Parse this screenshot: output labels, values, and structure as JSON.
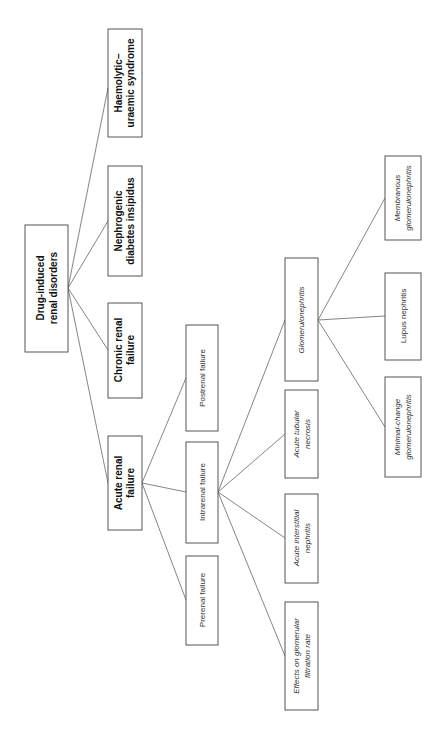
{
  "diagram": {
    "orientation": "rotated-90-ccw",
    "root": {
      "id": "root",
      "lines": [
        "Drug-induced",
        "renal disorders"
      ],
      "style": "bold"
    },
    "level1": [
      {
        "id": "hus",
        "lines": [
          "Haemolytic–",
          "uraemic syndrome"
        ],
        "style": "bold"
      },
      {
        "id": "ndi",
        "lines": [
          "Nephrogenic",
          "diabetes insipidus"
        ],
        "style": "bold"
      },
      {
        "id": "crf",
        "lines": [
          "Chronic renal",
          "failure"
        ],
        "style": "bold"
      },
      {
        "id": "arf",
        "lines": [
          "Acute renal",
          "failure"
        ],
        "style": "bold"
      }
    ],
    "level2": [
      {
        "id": "post",
        "lines": [
          "Postrenal failure"
        ],
        "style": "normal"
      },
      {
        "id": "intra",
        "lines": [
          "Intrarenal failure"
        ],
        "style": "normal"
      },
      {
        "id": "pre",
        "lines": [
          "Prerenal failure"
        ],
        "style": "normal"
      }
    ],
    "level3": [
      {
        "id": "gn",
        "lines": [
          "Glomerulonephritis"
        ],
        "style": "italic"
      },
      {
        "id": "atn",
        "lines": [
          "Acute tubular",
          "necrosis"
        ],
        "style": "italic"
      },
      {
        "id": "ain",
        "lines": [
          "Acute interstitial",
          "nephritis"
        ],
        "style": "italic"
      },
      {
        "id": "gfr",
        "lines": [
          "Effects on glomerular",
          "filtration rate"
        ],
        "style": "italic"
      }
    ],
    "level4": [
      {
        "id": "mgn",
        "lines": [
          "Membranous",
          "glomerulonephritis"
        ],
        "style": "italic"
      },
      {
        "id": "lupus",
        "lines": [
          "Lupus nephritis"
        ],
        "style": "normal"
      },
      {
        "id": "mcg",
        "lines": [
          "Minimal-change",
          "glomerulonephritis"
        ],
        "style": "italic"
      }
    ],
    "edges": [
      [
        "root",
        "hus"
      ],
      [
        "root",
        "ndi"
      ],
      [
        "root",
        "crf"
      ],
      [
        "root",
        "arf"
      ],
      [
        "arf",
        "post"
      ],
      [
        "arf",
        "intra"
      ],
      [
        "arf",
        "pre"
      ],
      [
        "intra",
        "gn"
      ],
      [
        "intra",
        "atn"
      ],
      [
        "intra",
        "ain"
      ],
      [
        "intra",
        "gfr"
      ],
      [
        "gn",
        "mgn"
      ],
      [
        "gn",
        "lupus"
      ],
      [
        "gn",
        "mcg"
      ]
    ],
    "colors": {
      "line": "#666666",
      "border": "#555555",
      "text": "#222222",
      "background": "#ffffff"
    }
  }
}
